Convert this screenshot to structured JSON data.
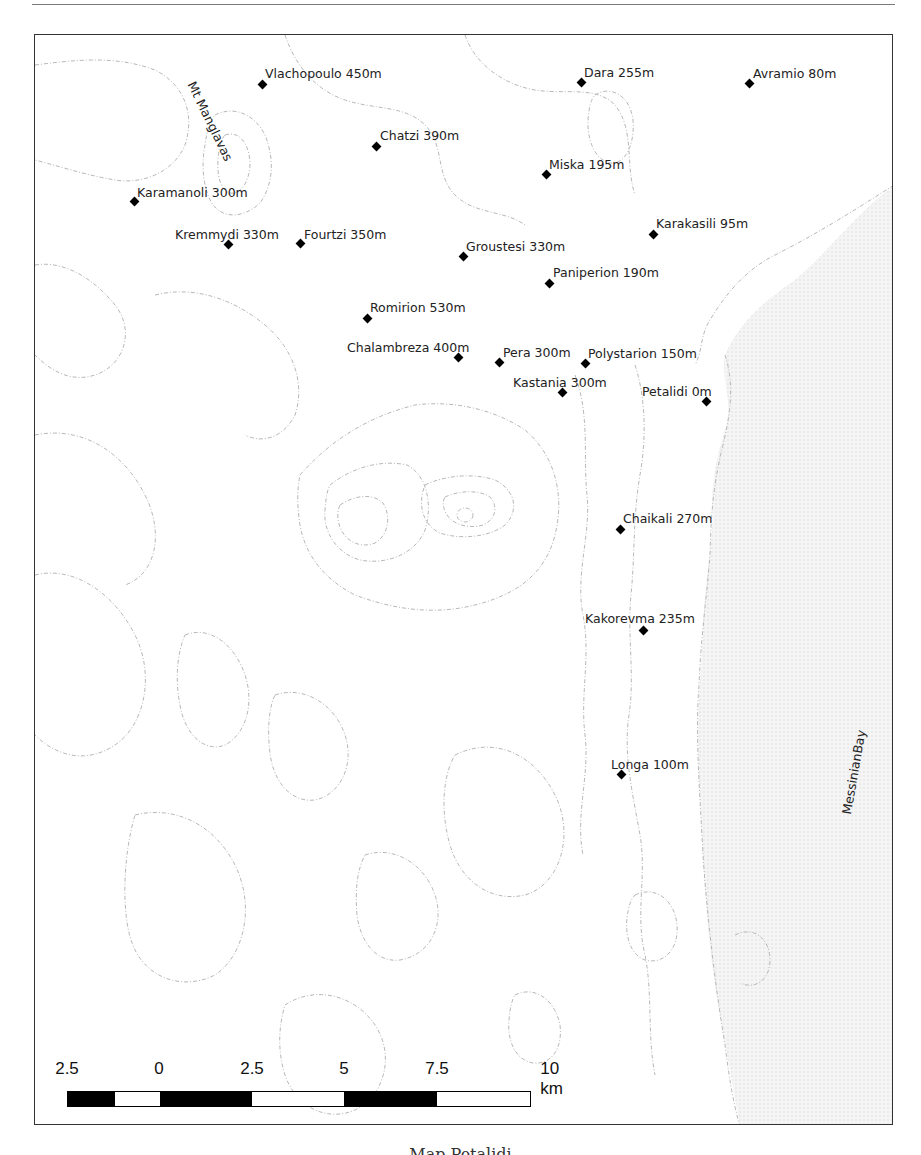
{
  "map": {
    "feature_labels": [
      {
        "text": "Mt Manglavas",
        "x": 163,
        "y": 44,
        "rotate": 64
      },
      {
        "text": "MessinianBay",
        "x": 804,
        "y": 778,
        "rotate": -80
      }
    ],
    "places": [
      {
        "name": "Vlachopoulo 450m",
        "mx": 227,
        "my": 49,
        "lx": 230,
        "ly": 31
      },
      {
        "name": "Dara 255m",
        "mx": 546,
        "my": 47,
        "lx": 549,
        "ly": 30
      },
      {
        "name": "Avramio 80m",
        "mx": 714,
        "my": 48,
        "lx": 718,
        "ly": 31
      },
      {
        "name": "Chatzi 390m",
        "mx": 341,
        "my": 111,
        "lx": 345,
        "ly": 93
      },
      {
        "name": "Miska 195m",
        "mx": 511,
        "my": 139,
        "lx": 514,
        "ly": 122
      },
      {
        "name": "Karamanoli 300m",
        "mx": 99,
        "my": 166,
        "lx": 102,
        "ly": 150
      },
      {
        "name": "Kremmydi 330m",
        "mx": 193,
        "my": 209,
        "lx": 140,
        "ly": 192
      },
      {
        "name": "Fourtzi 350m",
        "mx": 265,
        "my": 208,
        "lx": 269,
        "ly": 192
      },
      {
        "name": "Karakasili 95m",
        "mx": 618,
        "my": 199,
        "lx": 621,
        "ly": 181
      },
      {
        "name": "Groustesi 330m",
        "mx": 428,
        "my": 221,
        "lx": 431,
        "ly": 204
      },
      {
        "name": "Paniperion 190m",
        "mx": 514,
        "my": 248,
        "lx": 518,
        "ly": 230
      },
      {
        "name": "Romirion 530m",
        "mx": 332,
        "my": 283,
        "lx": 335,
        "ly": 265
      },
      {
        "name": "Chalambreza 400m",
        "mx": 423,
        "my": 322,
        "lx": 312,
        "ly": 305
      },
      {
        "name": "Pera 300m",
        "mx": 464,
        "my": 327,
        "lx": 468,
        "ly": 310
      },
      {
        "name": "Polystarion 150m",
        "mx": 550,
        "my": 328,
        "lx": 553,
        "ly": 311
      },
      {
        "name": "Kastania 300m",
        "mx": 527,
        "my": 357,
        "lx": 478,
        "ly": 340
      },
      {
        "name": "Petalidi 0m",
        "mx": 671,
        "my": 366,
        "lx": 607,
        "ly": 349
      },
      {
        "name": "Chaikali 270m",
        "mx": 585,
        "my": 494,
        "lx": 588,
        "ly": 476
      },
      {
        "name": "Kakorevma 235m",
        "mx": 608,
        "my": 595,
        "lx": 550,
        "ly": 576
      },
      {
        "name": "Longa 100m",
        "mx": 586,
        "my": 739,
        "lx": 576,
        "ly": 722
      }
    ],
    "colors": {
      "contour": "#b8b8b8",
      "sea": "#efefef",
      "marker": "#000000",
      "frame": "#333333"
    }
  },
  "scalebar": {
    "labels": [
      {
        "text": "2.5",
        "x": 0
      },
      {
        "text": "0",
        "x": 92
      },
      {
        "text": "2.5",
        "x": 185
      },
      {
        "text": "5",
        "x": 277
      },
      {
        "text": "7.5",
        "x": 370
      },
      {
        "text": "10 km",
        "x": 480
      }
    ],
    "segments": [
      {
        "w": 47,
        "c": "#000"
      },
      {
        "w": 45,
        "c": "#fff"
      },
      {
        "w": 93,
        "c": "#000"
      },
      {
        "w": 92,
        "c": "#fff"
      },
      {
        "w": 94,
        "c": "#000"
      },
      {
        "w": 93,
        "c": "#fff"
      }
    ]
  },
  "caption": {
    "text": "Map  Petalidi"
  }
}
